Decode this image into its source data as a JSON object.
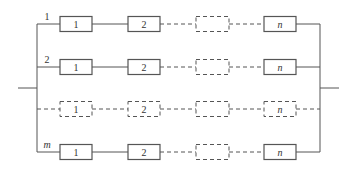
{
  "diagram": {
    "type": "parallel-series reliability block diagram",
    "colors": {
      "line": "#555555",
      "text": "#333333",
      "background": "#ffffff"
    },
    "rows": [
      {
        "label": "1",
        "label_italic": false,
        "y": 24,
        "dashed_row": false,
        "blocks": [
          {
            "text": "1",
            "dashed": false
          },
          {
            "text": "2",
            "dashed": false
          },
          {
            "text": "",
            "dashed": true
          },
          {
            "text": "n",
            "dashed": false
          }
        ]
      },
      {
        "label": "2",
        "label_italic": false,
        "y": 67,
        "dashed_row": false,
        "blocks": [
          {
            "text": "1",
            "dashed": false
          },
          {
            "text": "2",
            "dashed": false
          },
          {
            "text": "",
            "dashed": true
          },
          {
            "text": "n",
            "dashed": false
          }
        ]
      },
      {
        "label": "",
        "label_italic": false,
        "y": 109,
        "dashed_row": true,
        "blocks": [
          {
            "text": "1",
            "dashed": true
          },
          {
            "text": "2",
            "dashed": true
          },
          {
            "text": "",
            "dashed": true
          },
          {
            "text": "n",
            "dashed": true
          }
        ]
      },
      {
        "label": "m",
        "label_italic": true,
        "y": 152,
        "dashed_row": false,
        "blocks": [
          {
            "text": "1",
            "dashed": false
          },
          {
            "text": "2",
            "dashed": false
          },
          {
            "text": "",
            "dashed": true
          },
          {
            "text": "n",
            "dashed": false
          }
        ]
      }
    ]
  }
}
